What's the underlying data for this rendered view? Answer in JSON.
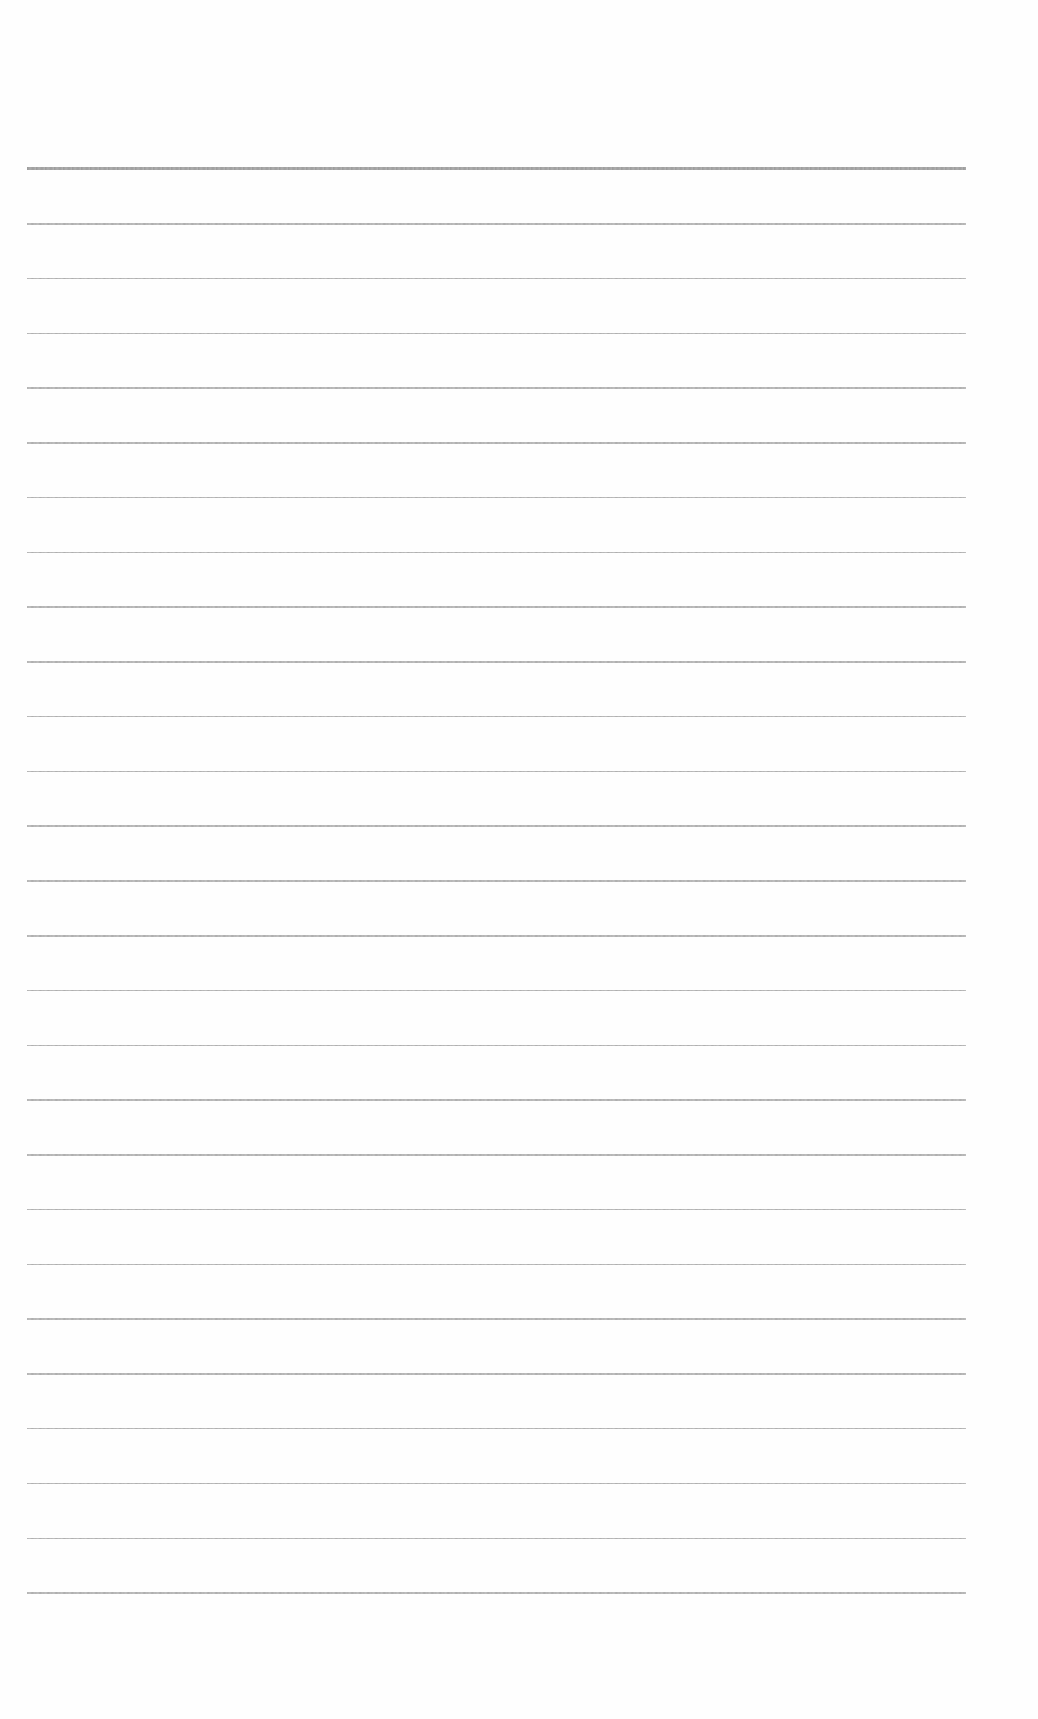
{
  "document": {
    "type": "lined-paper",
    "line_count": 27,
    "first_line_y": 169,
    "line_spacing": 54.77,
    "line_left": 27,
    "line_right": 966,
    "header_rule_thickness": 3,
    "rule_thickness": 1.5,
    "rule_color": "#aaaaaa",
    "header_rule_color": "#999999",
    "background_color": "#ffffff",
    "text": []
  }
}
